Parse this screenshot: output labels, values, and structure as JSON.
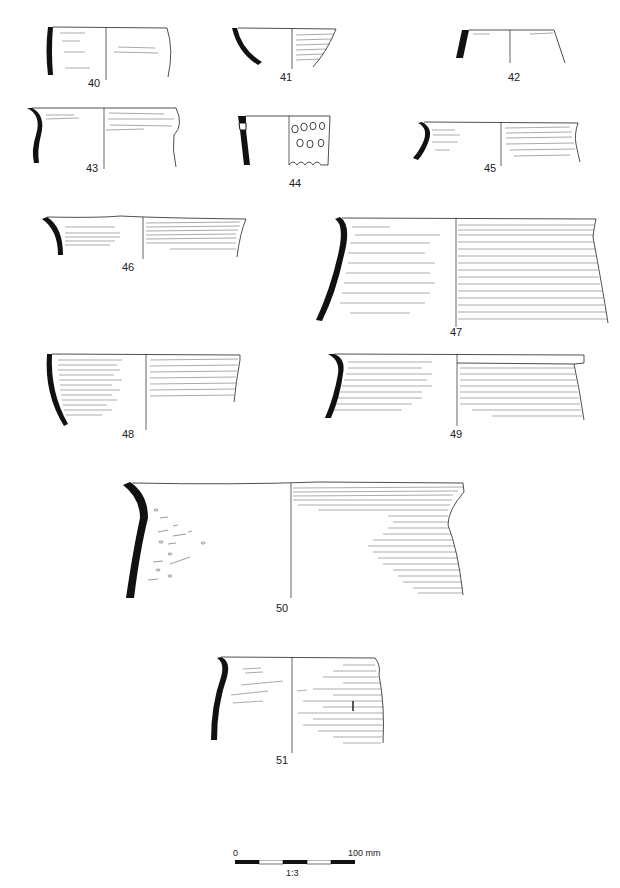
{
  "plate": {
    "subject": "Pottery rim sherd profiles",
    "colors": {
      "ink": "#111111",
      "background": "#ffffff",
      "hatch": "#333333"
    }
  },
  "figures": [
    {
      "id": "40",
      "label": "40"
    },
    {
      "id": "41",
      "label": "41"
    },
    {
      "id": "42",
      "label": "42"
    },
    {
      "id": "43",
      "label": "43"
    },
    {
      "id": "44",
      "label": "44"
    },
    {
      "id": "45",
      "label": "45"
    },
    {
      "id": "46",
      "label": "46"
    },
    {
      "id": "47",
      "label": "47"
    },
    {
      "id": "48",
      "label": "48"
    },
    {
      "id": "49",
      "label": "49"
    },
    {
      "id": "50",
      "label": "50"
    },
    {
      "id": "51",
      "label": "51"
    }
  ],
  "scale_bar": {
    "start_label": "0",
    "end_label": "100 mm",
    "ratio": "1:3",
    "segments": 5
  }
}
